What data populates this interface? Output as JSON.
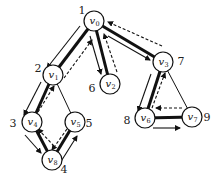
{
  "diagram": {
    "type": "dfs-traversal-graph",
    "nodes": [
      {
        "id": "v0",
        "name": "v",
        "sub": "0",
        "x": 94,
        "y": 21,
        "order": "1",
        "ox": 82,
        "oy": 14
      },
      {
        "id": "v1",
        "name": "v",
        "sub": "1",
        "x": 53,
        "y": 75,
        "order": "2",
        "ox": 38,
        "oy": 72
      },
      {
        "id": "v2",
        "name": "v",
        "sub": "2",
        "x": 110,
        "y": 84,
        "order": "6",
        "ox": 92,
        "oy": 92
      },
      {
        "id": "v3",
        "name": "v",
        "sub": "3",
        "x": 163,
        "y": 62,
        "order": "7",
        "ox": 181,
        "oy": 65
      },
      {
        "id": "v4",
        "name": "v",
        "sub": "4",
        "x": 32,
        "y": 122,
        "order": "3",
        "ox": 13,
        "oy": 127
      },
      {
        "id": "v5",
        "name": "v",
        "sub": "5",
        "x": 75,
        "y": 122,
        "order": "5",
        "ox": 89,
        "oy": 127
      },
      {
        "id": "v6",
        "name": "v",
        "sub": "6",
        "x": 145,
        "y": 118,
        "order": "8",
        "ox": 127,
        "oy": 124
      },
      {
        "id": "v7",
        "name": "v",
        "sub": "7",
        "x": 192,
        "y": 117,
        "order": "9",
        "ox": 207,
        "oy": 121
      },
      {
        "id": "v8",
        "name": "v",
        "sub": "8",
        "x": 52,
        "y": 160,
        "order": "4",
        "ox": 64,
        "oy": 173
      }
    ],
    "tree_edges": [
      [
        "v0",
        "v1"
      ],
      [
        "v1",
        "v4"
      ],
      [
        "v4",
        "v8"
      ],
      [
        "v8",
        "v5"
      ],
      [
        "v0",
        "v2"
      ],
      [
        "v0",
        "v3"
      ],
      [
        "v3",
        "v6"
      ],
      [
        "v6",
        "v7"
      ]
    ],
    "non_tree_edges": [
      [
        "v1",
        "v5"
      ],
      [
        "v3",
        "v7"
      ]
    ],
    "legend": {
      "solid_arrow": "forward traversal",
      "dashed_arrow": "backtrack"
    }
  }
}
